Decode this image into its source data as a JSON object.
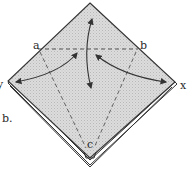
{
  "diagram": {
    "type": "origami-fold-step",
    "step_label": "b.",
    "points": {
      "a": "a",
      "b": "b",
      "c": "c",
      "x": "x",
      "y": "y"
    },
    "fill_color": "#d6d6d6",
    "line_color": "#333333",
    "arrows": [
      {
        "from": "center",
        "to": "top-corner",
        "kind": "fold-and-unfold"
      },
      {
        "from": "center",
        "to": "y",
        "kind": "fold-and-unfold"
      },
      {
        "from": "center",
        "to": "x",
        "kind": "fold-and-unfold"
      }
    ],
    "fold_lines": [
      {
        "from": "a",
        "to": "b",
        "style": "dashed"
      },
      {
        "from": "a",
        "to": "c",
        "style": "dashed"
      },
      {
        "from": "b",
        "to": "c",
        "style": "dashed"
      }
    ]
  }
}
